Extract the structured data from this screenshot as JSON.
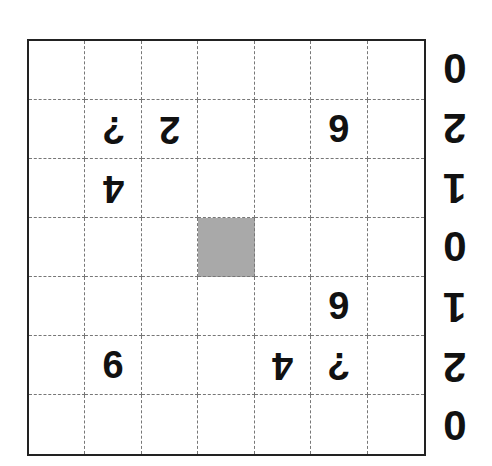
{
  "puzzle": {
    "rows": 7,
    "cols": 7,
    "shaded_cell": {
      "row": 3,
      "col": 3
    },
    "cells": [
      [
        "",
        "",
        "",
        "",
        "",
        "",
        ""
      ],
      [
        "",
        "?",
        "2",
        "",
        "",
        "9",
        ""
      ],
      [
        "",
        "4",
        "",
        "",
        "",
        "",
        ""
      ],
      [
        "",
        "",
        "",
        "",
        "",
        "",
        ""
      ],
      [
        "",
        "",
        "",
        "",
        "",
        "9",
        ""
      ],
      [
        "",
        "6",
        "",
        "",
        "4",
        "?",
        ""
      ],
      [
        "",
        "",
        "",
        "",
        "",
        "",
        ""
      ]
    ],
    "flipped": [
      [
        false,
        false,
        false,
        false,
        false,
        false,
        false
      ],
      [
        false,
        true,
        true,
        false,
        false,
        false,
        false
      ],
      [
        false,
        true,
        false,
        false,
        false,
        false,
        false
      ],
      [
        false,
        false,
        false,
        false,
        false,
        false,
        false
      ],
      [
        false,
        false,
        false,
        false,
        false,
        false,
        false
      ],
      [
        false,
        false,
        false,
        false,
        true,
        true,
        false
      ],
      [
        false,
        false,
        false,
        false,
        false,
        false,
        false
      ]
    ],
    "side_labels": [
      "0",
      "2",
      "1",
      "0",
      "1",
      "2",
      "0"
    ],
    "side_flipped": [
      false,
      true,
      true,
      false,
      true,
      true,
      false
    ],
    "colors": {
      "shade": "#a9a9a9",
      "border": "#222222",
      "grid_line": "#777777"
    }
  }
}
